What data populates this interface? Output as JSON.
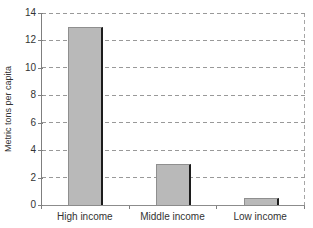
{
  "chart_data": {
    "type": "bar",
    "categories": [
      "High income",
      "Middle income",
      "Low income"
    ],
    "values": [
      13,
      3,
      0.5
    ],
    "title": "",
    "xlabel": "",
    "ylabel": "Metric tons per capita",
    "ylim": [
      0,
      14
    ],
    "yticks": [
      0,
      2,
      4,
      6,
      8,
      10,
      12,
      14
    ],
    "grid": "horizontal-dashed",
    "legend": "none",
    "colors": {
      "bar_fill": "#b9b9b9",
      "bar_outline": "#8f8f8f",
      "bar_shadow": "#1c1c1c",
      "gridline": "#999999",
      "axis": "#7f7f7f",
      "text": "#333333",
      "background": "#ffffff"
    }
  }
}
